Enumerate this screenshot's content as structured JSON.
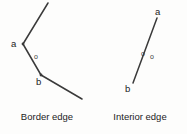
{
  "figure": {
    "width": 187,
    "height": 134,
    "background_color": "#fdfdfc",
    "stroke_color": "#3a3a3a",
    "text_color": "#1c1c1c"
  },
  "panels": [
    {
      "id": "border-edge",
      "caption": "Border edge",
      "description": "A V-shaped open polyline bending at two labelled vertices a and b, with a single small circle marker o on the interior side of the segment between a and b.",
      "polyline_points": "48,3 23,44 41,75 82,99",
      "vertices": [
        {
          "name": "a",
          "label": "a",
          "x": 23,
          "y": 44,
          "label_x": 11,
          "label_y": 39
        },
        {
          "name": "b",
          "label": "b",
          "x": 41,
          "y": 75,
          "label_x": 36,
          "label_y": 77
        }
      ],
      "markers": [
        {
          "name": "o",
          "label": "o",
          "cx": 37,
          "cy": 57,
          "r": 2,
          "label_x": 34,
          "label_y": 54
        }
      ],
      "marker_count": 1
    },
    {
      "id": "interior-edge",
      "caption": "Interior edge",
      "description": "A single straight open segment from labelled endpoint a at the top to labelled endpoint b at the bottom, with two small circle markers o placed on opposite sides of the segment.",
      "polyline_points": "157,18 133,83",
      "vertices": [
        {
          "name": "a",
          "label": "a",
          "x": 157,
          "y": 18,
          "label_x": 155,
          "label_y": 7
        },
        {
          "name": "b",
          "label": "b",
          "x": 133,
          "y": 83,
          "label_x": 125,
          "label_y": 84
        }
      ],
      "markers": [
        {
          "name": "o-left",
          "label": "o",
          "cx": 144,
          "cy": 54,
          "r": 2,
          "label_x": 141,
          "label_y": 51
        },
        {
          "name": "o-right",
          "label": "o",
          "cx": 153,
          "cy": 57,
          "r": 2,
          "label_x": 150,
          "label_y": 54
        }
      ],
      "marker_count": 2
    }
  ]
}
